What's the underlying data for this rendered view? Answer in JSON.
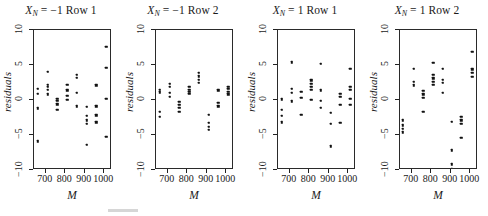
{
  "figure": {
    "axis_ylabel": "residuals",
    "axis_xlabel": "M",
    "ylim": [
      -10,
      10
    ],
    "xlim": [
      640,
      1040
    ],
    "yticks": [
      10,
      5,
      0,
      -5,
      -10
    ],
    "ytick_labels": [
      "10",
      "5",
      "0",
      "−5",
      "−10"
    ],
    "xticks": [
      700,
      800,
      900,
      1000
    ],
    "xtick_labels": [
      "700",
      "800",
      "900",
      "1000"
    ],
    "point_color": "#111111",
    "frame_color": "#2a2a2a"
  },
  "chart_data": {
    "type": "scatter",
    "title": "",
    "xlabel": "M",
    "ylabel": "residuals",
    "xlim": [
      640,
      1040
    ],
    "ylim": [
      -10,
      10
    ],
    "grid": false,
    "legend": "none",
    "panels": [
      {
        "title_prefix": "X",
        "title_sub": "N",
        "title_rest": " = −1 Row 1",
        "title_full": "X_N = −1 Row 1",
        "points": [
          [
            660,
            1.6
          ],
          [
            660,
            0.9
          ],
          [
            660,
            -1.2
          ],
          [
            660,
            -5.9
          ],
          [
            710,
            4.0
          ],
          [
            710,
            2.2
          ],
          [
            710,
            1.9
          ],
          [
            710,
            1.5
          ],
          [
            710,
            0.8
          ],
          [
            760,
            0.2
          ],
          [
            760,
            -0.1
          ],
          [
            760,
            -0.6
          ],
          [
            760,
            -1.4
          ],
          [
            810,
            2.2
          ],
          [
            810,
            1.4
          ],
          [
            810,
            0.6
          ],
          [
            810,
            0.0
          ],
          [
            860,
            3.6
          ],
          [
            860,
            3.2
          ],
          [
            860,
            1.0
          ],
          [
            860,
            -0.9
          ],
          [
            910,
            -1.0
          ],
          [
            910,
            -2.3
          ],
          [
            910,
            -2.9
          ],
          [
            910,
            -3.4
          ],
          [
            910,
            -6.4
          ],
          [
            960,
            2.1
          ],
          [
            960,
            -0.9
          ],
          [
            960,
            -2.2
          ],
          [
            960,
            -3.2
          ],
          [
            1010,
            7.6
          ],
          [
            1010,
            4.6
          ],
          [
            1010,
            0.2
          ],
          [
            1010,
            -5.3
          ]
        ]
      },
      {
        "title_prefix": "X",
        "title_sub": "N",
        "title_rest": " = −1 Row 2",
        "title_full": "X_N = −1 Row 2",
        "points": [
          [
            660,
            1.5
          ],
          [
            660,
            1.1
          ],
          [
            660,
            -1.7
          ],
          [
            660,
            -2.4
          ],
          [
            710,
            2.3
          ],
          [
            710,
            1.9
          ],
          [
            710,
            1.0
          ],
          [
            710,
            0.5
          ],
          [
            760,
            -0.3
          ],
          [
            760,
            -0.7
          ],
          [
            760,
            -1.1
          ],
          [
            760,
            -1.7
          ],
          [
            810,
            1.9
          ],
          [
            810,
            1.5
          ],
          [
            810,
            1.2
          ],
          [
            810,
            0.9
          ],
          [
            860,
            3.9
          ],
          [
            860,
            3.4
          ],
          [
            860,
            2.9
          ],
          [
            860,
            2.5
          ],
          [
            910,
            -2.1
          ],
          [
            910,
            -3.3
          ],
          [
            910,
            -3.8
          ],
          [
            910,
            -4.3
          ],
          [
            960,
            1.4
          ],
          [
            960,
            -0.4
          ],
          [
            960,
            -0.9
          ],
          [
            1010,
            1.9
          ],
          [
            1010,
            1.6
          ],
          [
            1010,
            1.2
          ],
          [
            1010,
            0.8
          ]
        ]
      },
      {
        "title_prefix": "X",
        "title_sub": "N",
        "title_rest": " = 1 Row 1",
        "title_full": "X_N = 1 Row 1",
        "points": [
          [
            660,
            0.1
          ],
          [
            660,
            -1.4
          ],
          [
            660,
            -2.3
          ],
          [
            660,
            -3.2
          ],
          [
            710,
            5.4
          ],
          [
            710,
            1.6
          ],
          [
            710,
            1.0
          ],
          [
            710,
            -0.2
          ],
          [
            760,
            1.2
          ],
          [
            760,
            0.3
          ],
          [
            760,
            -2.1
          ],
          [
            810,
            2.8
          ],
          [
            810,
            2.3
          ],
          [
            810,
            1.9
          ],
          [
            810,
            1.5
          ],
          [
            810,
            0.0
          ],
          [
            860,
            5.2
          ],
          [
            860,
            1.4
          ],
          [
            860,
            -0.1
          ],
          [
            860,
            -1.1
          ],
          [
            910,
            -1.8
          ],
          [
            910,
            -3.4
          ],
          [
            910,
            -6.6
          ],
          [
            960,
            0.9
          ],
          [
            960,
            0.5
          ],
          [
            960,
            -0.7
          ],
          [
            960,
            -3.3
          ],
          [
            1010,
            4.5
          ],
          [
            1010,
            1.9
          ],
          [
            1010,
            1.5
          ],
          [
            1010,
            0.2
          ],
          [
            1010,
            -0.7
          ]
        ]
      },
      {
        "title_prefix": "X",
        "title_sub": "N",
        "title_rest": " = 1 Row 2",
        "title_full": "X_N = 1 Row 2",
        "points": [
          [
            655,
            -2.9
          ],
          [
            655,
            -3.6
          ],
          [
            655,
            -4.1
          ],
          [
            655,
            -4.6
          ],
          [
            710,
            4.5
          ],
          [
            710,
            2.6
          ],
          [
            710,
            2.1
          ],
          [
            760,
            1.3
          ],
          [
            760,
            0.8
          ],
          [
            760,
            0.3
          ],
          [
            760,
            -1.7
          ],
          [
            810,
            5.3
          ],
          [
            810,
            3.6
          ],
          [
            810,
            3.1
          ],
          [
            810,
            2.6
          ],
          [
            810,
            2.2
          ],
          [
            860,
            4.5
          ],
          [
            860,
            2.9
          ],
          [
            860,
            2.5
          ],
          [
            860,
            1.0
          ],
          [
            905,
            -3.1
          ],
          [
            905,
            -7.2
          ],
          [
            905,
            -9.2
          ],
          [
            905,
            -9.9
          ],
          [
            955,
            -2.4
          ],
          [
            955,
            -2.9
          ],
          [
            955,
            -3.4
          ],
          [
            955,
            -5.4
          ],
          [
            1010,
            6.9
          ],
          [
            1010,
            4.4
          ],
          [
            1010,
            3.9
          ],
          [
            1010,
            3.3
          ]
        ]
      }
    ]
  }
}
